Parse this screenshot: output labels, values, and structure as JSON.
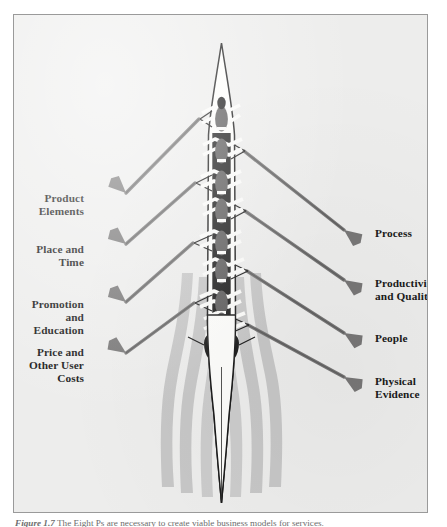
{
  "figure": {
    "title_alt": "The 8Ps of services marketing depicted as a rowing eight",
    "caption_lead": "Figure 1.7",
    "caption_text": "The Eight Ps are necessary to create viable business models for services."
  },
  "colors": {
    "panel_background": "#ededec",
    "panel_border": "#9a9a9a",
    "hull_fill": "#fdfdfb",
    "hull_stroke": "#1b1b1b",
    "rower_dark": "#1d1d1d",
    "rower_body": "#5e5d5d",
    "oar_gray": "#787777",
    "oar_shaft_white": "#fbfbf9",
    "wake_gray": "#c3c3c3",
    "label_text": "#1a1a1a",
    "caption_text": "#6d6d6d"
  },
  "labels": {
    "left": [
      {
        "id": "product",
        "text": "Product\nElements"
      },
      {
        "id": "place",
        "text": "Place and\nTime"
      },
      {
        "id": "promotion",
        "text": "Promotion and\nEducation"
      },
      {
        "id": "price",
        "text": "Price and\nOther User\nCosts"
      }
    ],
    "right": [
      {
        "id": "process",
        "text": "Process"
      },
      {
        "id": "productivity",
        "text": "Productivity\nand Quality"
      },
      {
        "id": "people",
        "text": "People"
      },
      {
        "id": "physical",
        "text": "Physical\nEvidence"
      }
    ]
  },
  "diagram_data": {
    "type": "annotated-illustration",
    "subject": "rowing eight (coxed eight shell) viewed from overhead",
    "rower_count": 8,
    "coxswain_count": 1,
    "oars_per_side": 4,
    "wake_streaks": 6,
    "label_count": 8,
    "left_label_count": 4,
    "right_label_count": 4
  }
}
